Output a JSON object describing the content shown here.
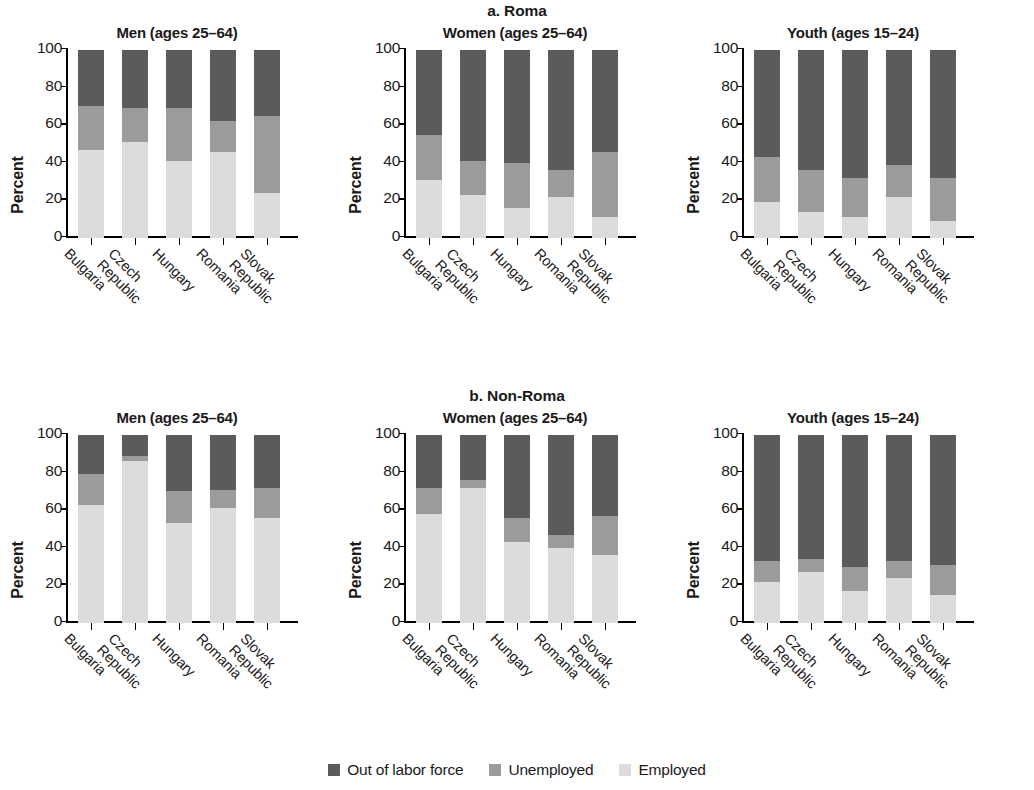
{
  "axis": {
    "ylabel": "Percent",
    "yticks": [
      "0",
      "20",
      "40",
      "60",
      "80",
      "100"
    ],
    "ymin": 0,
    "ymax": 100,
    "categories": [
      "Bulgaria",
      "Czech Republic",
      "Hungary",
      "Romania",
      "Slovak Republic"
    ],
    "category_lines": [
      [
        "Bulgaria",
        ""
      ],
      [
        "Czech",
        "Republic"
      ],
      [
        "Hungary",
        ""
      ],
      [
        "Romania",
        ""
      ],
      [
        "Slovak",
        "Republic"
      ]
    ]
  },
  "legend": {
    "items": [
      {
        "label": "Out of labor force",
        "color": "#5b5b5b"
      },
      {
        "label": "Unemployed",
        "color": "#9b9b9b"
      },
      {
        "label": "Employed",
        "color": "#dcdcdc"
      }
    ]
  },
  "sections": [
    {
      "id": "roma",
      "title": "a. Roma",
      "panels": [
        {
          "title": "Men (ages 25–64)"
        },
        {
          "title": "Women (ages 25–64)"
        },
        {
          "title": "Youth (ages 15–24)"
        }
      ]
    },
    {
      "id": "nonroma",
      "title": "b. Non-Roma",
      "panels": [
        {
          "title": "Men (ages 25–64)"
        },
        {
          "title": "Women (ages 25–64)"
        },
        {
          "title": "Youth (ages 15–24)"
        }
      ]
    }
  ],
  "chart_data": {
    "type": "bar",
    "subtype": "stacked-100-percent",
    "xlabel": "",
    "ylabel": "Percent",
    "ylim": [
      0,
      100
    ],
    "yticks": [
      0,
      20,
      40,
      60,
      80,
      100
    ],
    "grid": false,
    "legend_position": "bottom-center",
    "categories": [
      "Bulgaria",
      "Czech Republic",
      "Hungary",
      "Romania",
      "Slovak Republic"
    ],
    "series_names": [
      "Employed",
      "Unemployed",
      "Out of labor force"
    ],
    "series_colors": [
      "#dcdcdc",
      "#9b9b9b",
      "#5b5b5b"
    ],
    "panels": [
      {
        "group": "a. Roma",
        "panel": "Men (ages 25–64)",
        "series": [
          {
            "name": "Employed",
            "values": [
              47,
              51,
              41,
              46,
              24
            ]
          },
          {
            "name": "Unemployed",
            "values": [
              23,
              18,
              28,
              16,
              41
            ]
          },
          {
            "name": "Out of labor force",
            "values": [
              30,
              31,
              31,
              38,
              35
            ]
          }
        ]
      },
      {
        "group": "a. Roma",
        "panel": "Women (ages 25–64)",
        "series": [
          {
            "name": "Employed",
            "values": [
              31,
              23,
              16,
              22,
              11
            ]
          },
          {
            "name": "Unemployed",
            "values": [
              24,
              18,
              24,
              14,
              35
            ]
          },
          {
            "name": "Out of labor force",
            "values": [
              45,
              59,
              60,
              64,
              54
            ]
          }
        ]
      },
      {
        "group": "a. Roma",
        "panel": "Youth (ages 15–24)",
        "series": [
          {
            "name": "Employed",
            "values": [
              19,
              14,
              11,
              22,
              9
            ]
          },
          {
            "name": "Unemployed",
            "values": [
              24,
              22,
              21,
              17,
              23
            ]
          },
          {
            "name": "Out of labor force",
            "values": [
              57,
              64,
              68,
              61,
              68
            ]
          }
        ]
      },
      {
        "group": "b. Non-Roma",
        "panel": "Men (ages 25–64)",
        "series": [
          {
            "name": "Employed",
            "values": [
              63,
              86,
              53,
              61,
              56
            ]
          },
          {
            "name": "Unemployed",
            "values": [
              16,
              3,
              17,
              10,
              16
            ]
          },
          {
            "name": "Out of labor force",
            "values": [
              21,
              11,
              30,
              29,
              28
            ]
          }
        ]
      },
      {
        "group": "b. Non-Roma",
        "panel": "Women (ages 25–64)",
        "series": [
          {
            "name": "Employed",
            "values": [
              58,
              72,
              43,
              40,
              36
            ]
          },
          {
            "name": "Unemployed",
            "values": [
              14,
              4,
              13,
              7,
              21
            ]
          },
          {
            "name": "Out of labor force",
            "values": [
              28,
              24,
              44,
              53,
              43
            ]
          }
        ]
      },
      {
        "group": "b. Non-Roma",
        "panel": "Youth (ages 15–24)",
        "series": [
          {
            "name": "Employed",
            "values": [
              22,
              27,
              17,
              24,
              15
            ]
          },
          {
            "name": "Unemployed",
            "values": [
              11,
              7,
              13,
              9,
              16
            ]
          },
          {
            "name": "Out of labor force",
            "values": [
              67,
              66,
              70,
              67,
              69
            ]
          }
        ]
      }
    ]
  }
}
